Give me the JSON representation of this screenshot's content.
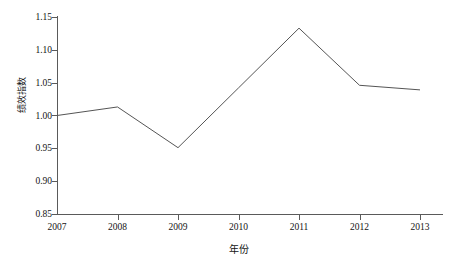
{
  "chart_data": {
    "type": "line",
    "title": "",
    "xlabel": "年份",
    "ylabel": "绩效指数",
    "categories": [
      "2007",
      "2008",
      "2009",
      "2010",
      "2011",
      "2012",
      "2013"
    ],
    "x": [
      2007,
      2008,
      2009,
      2010,
      2011,
      2012,
      2013
    ],
    "values": [
      1.0,
      1.013,
      0.951,
      1.042,
      1.133,
      1.046,
      1.039
    ],
    "series": [
      {
        "name": "绩效指数",
        "values": [
          1.0,
          1.013,
          0.951,
          1.042,
          1.133,
          1.046,
          1.039
        ]
      }
    ],
    "ylim": [
      0.85,
      1.15
    ],
    "xlim": [
      2007,
      2013
    ],
    "yticks": [
      0.85,
      0.9,
      0.95,
      1.0,
      1.05,
      1.1,
      1.15
    ],
    "ytick_labels": [
      "0.85",
      "0.90",
      "0.95",
      "1.00",
      "1.05",
      "1.10",
      "1.15"
    ],
    "xticks": [
      2007,
      2008,
      2009,
      2010,
      2011,
      2012,
      2013
    ],
    "xtick_labels": [
      "2007",
      "2008",
      "2009",
      "2010",
      "2011",
      "2012",
      "2013"
    ],
    "grid": false,
    "legend": false,
    "legend_position": "none",
    "markers": false,
    "line_color": "#555555",
    "line_width": 1,
    "axis_color": "#5a5a5a",
    "background_color": "#ffffff",
    "spines": [
      "left",
      "bottom"
    ],
    "annotations": []
  }
}
